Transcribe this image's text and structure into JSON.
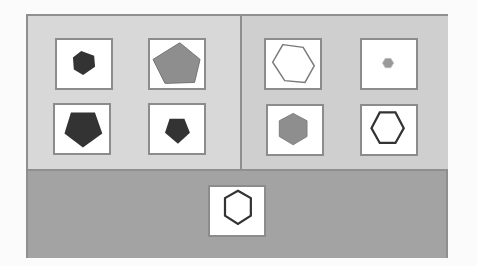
{
  "puzzle": {
    "description": "Shape analogy puzzle: left group of pentagons, right group of hexagons, answer option below",
    "colors": {
      "dark_fill": "#333333",
      "gray_fill": "#8e8e8e",
      "outline": "#333333",
      "light_outline": "#7a7a7a"
    },
    "left_panel": {
      "tiles": [
        {
          "shape": "pentagon",
          "style": "small dark filled, rotated"
        },
        {
          "shape": "pentagon",
          "style": "large gray filled"
        },
        {
          "shape": "pentagon",
          "style": "large dark filled"
        },
        {
          "shape": "pentagon",
          "style": "small dark filled"
        }
      ]
    },
    "right_panel": {
      "tiles": [
        {
          "shape": "hexagon",
          "style": "large white with gray outline, rotated"
        },
        {
          "shape": "hexagon",
          "style": "tiny gray filled"
        },
        {
          "shape": "hexagon",
          "style": "medium gray filled"
        },
        {
          "shape": "hexagon",
          "style": "medium white with dark outline"
        }
      ]
    },
    "answer_panel": {
      "tiles": [
        {
          "shape": "hexagon",
          "style": "medium white with dark outline, vertical"
        }
      ]
    }
  }
}
